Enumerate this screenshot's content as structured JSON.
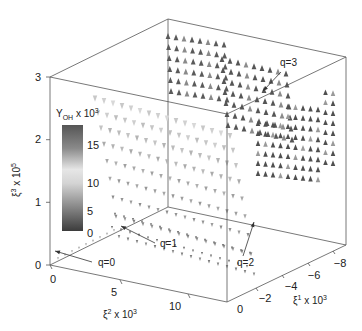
{
  "chart_data": {
    "type": "scatter3d",
    "title": "",
    "marker": "cone/triangle glyphs colored by Y_OH",
    "axes": {
      "x": {
        "label": "ξ² x 10³",
        "label_base": "ξ",
        "label_sup": "2",
        "label_rest": " x 10",
        "label_exp": "3",
        "ticks": [
          "0",
          "5",
          "10"
        ],
        "range": [
          0,
          13
        ]
      },
      "y": {
        "label": "ξ¹ x 10³",
        "label_base": "ξ",
        "label_sup": "1",
        "label_rest": " x 10",
        "label_exp": "3",
        "ticks": [
          "0",
          "−2",
          "−4",
          "−6",
          "−8"
        ],
        "range": [
          0,
          -9
        ]
      },
      "z": {
        "label": "ξ³ x 10⁵",
        "label_base": "ξ",
        "label_sup": "3",
        "label_rest": " x 10",
        "label_exp": "5",
        "ticks": [
          "0",
          "1",
          "2",
          "3"
        ],
        "range": [
          0,
          3
        ]
      }
    },
    "colorbar": {
      "title_main": "Y",
      "title_sub": "OH",
      "title_rest": " x 10",
      "title_exp": "3",
      "label": "Y_OH x 10^3",
      "ticks": [
        "15",
        "10",
        "5",
        "0"
      ],
      "range": [
        0,
        18
      ],
      "colormap": "dark-light-dark grayscale"
    },
    "annotations": [
      {
        "text": "q=0",
        "tx": 98,
        "ty": 266,
        "ax1": 92,
        "ay1": 262,
        "ax2": 55,
        "ay2": 251
      },
      {
        "text": "q=1",
        "tx": 160,
        "ty": 247,
        "ax1": 155,
        "ay1": 243,
        "ax2": 121,
        "ay2": 226
      },
      {
        "text": "q=2",
        "tx": 237,
        "ty": 266,
        "ax1": 243,
        "ay1": 256,
        "ax2": 254,
        "ay2": 222
      },
      {
        "text": "q=3",
        "tx": 280,
        "ty": 66,
        "ax1": 281,
        "ay1": 72,
        "ax2": 263,
        "ay2": 91
      }
    ],
    "series": [
      {
        "name": "q=0",
        "description": "near-origin faint ridge along ξ² axis at ξ³≈0",
        "Y_OH_approx": 10
      },
      {
        "name": "q=1",
        "description": "light gray cone sheet rising from ξ³=0 curving upward, mid Y_OH",
        "Y_OH_approx": 9
      },
      {
        "name": "q=2",
        "description": "surface along ξ¹ direction near front edge",
        "Y_OH_approx": 7
      },
      {
        "name": "q=3",
        "description": "dark triangles at high ξ³ and far ξ¹",
        "Y_OH_approx": 16
      }
    ]
  }
}
